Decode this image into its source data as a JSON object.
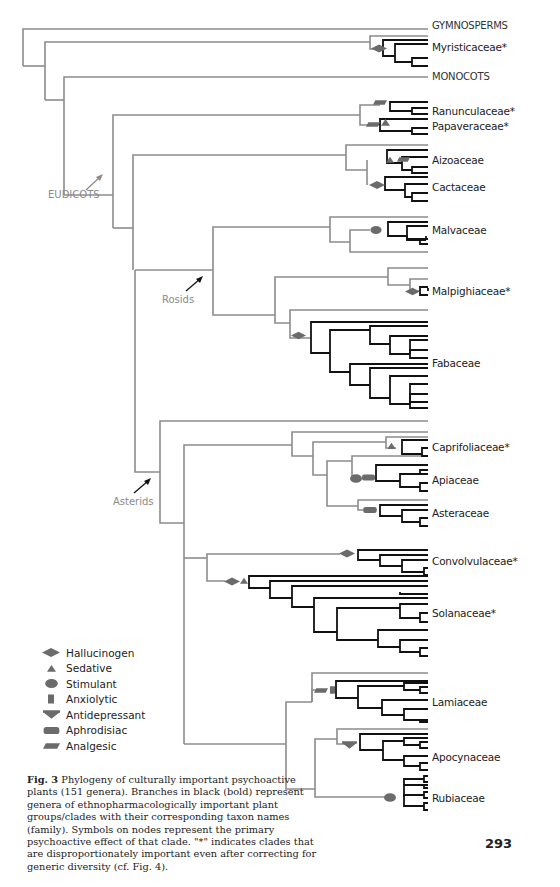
{
  "figure": {
    "number_label": "Fig. 3",
    "caption": "Phylogeny of culturally important psychoactive plants (151 genera). Branches in black (bold) represent genera of ethnopharmacologically important plant groups/clades with their corresponding taxon names (family). Symbols on nodes represent the primary psychoactive effect of that clade. \"*\" indicates clades that are disproportionately important even after correcting for generic diversity (cf. Fig. 4).",
    "page_number": "293"
  },
  "colors": {
    "grey_branch": "#8c8c8c",
    "black_branch": "#111111",
    "symbol": "#6b6b6b",
    "clade_label": "#8a8a8a"
  },
  "major_groups": [
    {
      "name": "GYMNOSPERMS",
      "y": 26
    },
    {
      "name": "MONOCOTS",
      "y": 77
    }
  ],
  "families": [
    {
      "name": "Myristicaceae*",
      "y": 47,
      "effect": "Hallucinogen"
    },
    {
      "name": "Ranunculaceae*",
      "y": 112,
      "effect": "Analgesic"
    },
    {
      "name": "Papaveraceae*",
      "y": 126,
      "effect": "Sedative / Analgesic"
    },
    {
      "name": "Aizoaceae",
      "y": 160,
      "effect": "Sedative / Analgesic"
    },
    {
      "name": "Cactaceae",
      "y": 187,
      "effect": "Hallucinogen"
    },
    {
      "name": "Malvaceae",
      "y": 230,
      "effect": "Stimulant"
    },
    {
      "name": "Malpighiaceae*",
      "y": 291,
      "effect": "Hallucinogen"
    },
    {
      "name": "Fabaceae",
      "y": 363,
      "effect": "Hallucinogen"
    },
    {
      "name": "Caprifoliaceae*",
      "y": 447,
      "effect": "Sedative"
    },
    {
      "name": "Apiaceae",
      "y": 480,
      "effect": "Stimulant / Aphrodisiac"
    },
    {
      "name": "Asteraceae",
      "y": 513,
      "effect": "Aphrodisiac"
    },
    {
      "name": "Convolvulaceae*",
      "y": 561,
      "effect": "Hallucinogen"
    },
    {
      "name": "Solanaceae*",
      "y": 613,
      "effect": "Hallucinogen / Sedative"
    },
    {
      "name": "Lamiaceae",
      "y": 702,
      "effect": "Analgesic / Anxiolytic"
    },
    {
      "name": "Apocynaceae",
      "y": 757,
      "effect": "Antidepressant"
    },
    {
      "name": "Rubiaceae",
      "y": 798,
      "effect": "Stimulant"
    }
  ],
  "clade_labels": [
    {
      "name": "EUDICOTS",
      "x": 48,
      "y": 190
    },
    {
      "name": "Rosids",
      "x": 164,
      "y": 296
    },
    {
      "name": "Asterids",
      "x": 114,
      "y": 497
    }
  ],
  "legend": [
    {
      "symbol": "hallucinogen",
      "label": "Hallucinogen"
    },
    {
      "symbol": "sedative",
      "label": "Sedative"
    },
    {
      "symbol": "stimulant",
      "label": "Stimulant"
    },
    {
      "symbol": "anxiolytic",
      "label": "Anxiolytic"
    },
    {
      "symbol": "antidepressant",
      "label": "Antidepressant"
    },
    {
      "symbol": "aphrodisiac",
      "label": "Aphrodisiac"
    },
    {
      "symbol": "analgesic",
      "label": "Analgesic"
    }
  ]
}
